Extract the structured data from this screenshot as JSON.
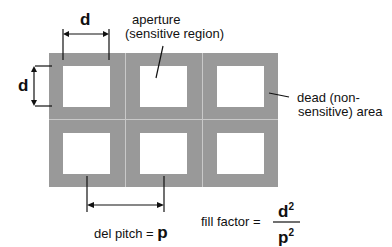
{
  "diagram": {
    "labels": {
      "d_horizontal": "d",
      "d_vertical": "d",
      "aperture_line1": "aperture",
      "aperture_line2": "(sensitive region)",
      "dead_line1": "dead (non-",
      "dead_line2": "sensitive) area",
      "pitch_text": "del  pitch =",
      "pitch_symbol": "p",
      "fill_text": "fill   factor =",
      "numerator": "d",
      "denominator": "p",
      "exponent": "2"
    },
    "grid": {
      "rows": 2,
      "cols": 3
    },
    "colors": {
      "dead_area": "#999999",
      "aperture": "#ffffff",
      "divider": "#c9c9c9",
      "ink": "#111111"
    }
  }
}
